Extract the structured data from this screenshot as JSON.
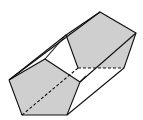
{
  "diagram": {
    "type": "pentagonal-prism",
    "colors": {
      "face_fill": "#cfcfcf",
      "stroke": "#111111",
      "background": "#ffffff"
    },
    "back_face": "9,80 45,59 80,82 67,115 22,115",
    "front_face": "100,12 136,33 124,68 78,68 66,35"
  }
}
